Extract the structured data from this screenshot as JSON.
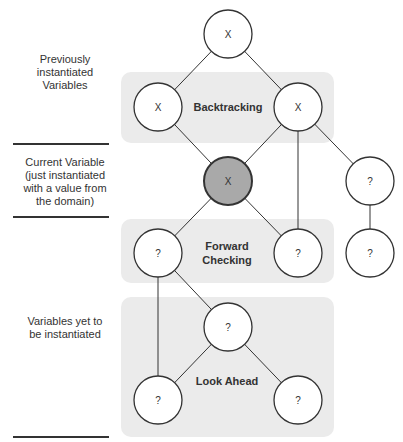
{
  "legend": {
    "previous": "Previously instantiated Variables",
    "previous_lines": [
      "Previously",
      "instantiated",
      "Variables"
    ],
    "current_lines": [
      "Current Variable",
      "(just instantiated",
      "with a value from",
      "the domain)"
    ],
    "future_lines": [
      "Variables yet to",
      "be instantiated"
    ]
  },
  "regions": {
    "backtracking": "Backtracking",
    "forward_checking_lines": [
      "Forward",
      "Checking"
    ],
    "look_ahead": "Look Ahead"
  },
  "colors": {
    "region_fill": "#ebebeb",
    "node_fill": "#ffffff",
    "current_node_fill": "#a9a9a9",
    "stroke": "#333333"
  },
  "nodes": [
    {
      "id": "n1",
      "label": "X",
      "x": 228,
      "y": 34,
      "current": false
    },
    {
      "id": "n2",
      "label": "X",
      "x": 158,
      "y": 107,
      "current": false
    },
    {
      "id": "n3",
      "label": "X",
      "x": 298,
      "y": 107,
      "current": false
    },
    {
      "id": "n4",
      "label": "X",
      "x": 228,
      "y": 181,
      "current": true
    },
    {
      "id": "n5",
      "label": "?",
      "x": 370,
      "y": 181,
      "current": false
    },
    {
      "id": "n6",
      "label": "?",
      "x": 158,
      "y": 253,
      "current": false
    },
    {
      "id": "n7",
      "label": "?",
      "x": 298,
      "y": 253,
      "current": false
    },
    {
      "id": "n8",
      "label": "?",
      "x": 370,
      "y": 253,
      "current": false
    },
    {
      "id": "n9",
      "label": "?",
      "x": 228,
      "y": 327,
      "current": false
    },
    {
      "id": "n10",
      "label": "?",
      "x": 158,
      "y": 400,
      "current": false
    },
    {
      "id": "n11",
      "label": "?",
      "x": 298,
      "y": 400,
      "current": false
    }
  ],
  "edges": [
    [
      "n1",
      "n2"
    ],
    [
      "n1",
      "n3"
    ],
    [
      "n2",
      "n4"
    ],
    [
      "n3",
      "n4"
    ],
    [
      "n3",
      "n5"
    ],
    [
      "n3",
      "n7"
    ],
    [
      "n4",
      "n6"
    ],
    [
      "n4",
      "n7"
    ],
    [
      "n5",
      "n8"
    ],
    [
      "n6",
      "n9"
    ],
    [
      "n6",
      "n10"
    ],
    [
      "n9",
      "n10"
    ],
    [
      "n9",
      "n11"
    ]
  ]
}
